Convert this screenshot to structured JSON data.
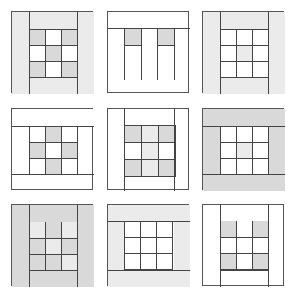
{
  "colors": {
    "gray": "#d9d9d9",
    "light": "#ebebeb",
    "white": "#ffffff",
    "line": "#444444"
  },
  "panels": [
    {
      "x": 11,
      "y": 11,
      "w": 82,
      "h": 82,
      "bands": [
        {
          "x": 0,
          "y": 0,
          "w": 17,
          "h": 82,
          "c": "light"
        },
        {
          "x": 65,
          "y": 0,
          "w": 17,
          "h": 82,
          "c": "light"
        },
        {
          "x": 17,
          "y": 0,
          "w": 48,
          "h": 17,
          "c": "light"
        },
        {
          "x": 17,
          "y": 65,
          "w": 48,
          "h": 17,
          "c": "light"
        }
      ],
      "vlines": [
        {
          "x": 17,
          "y": 0,
          "h": 82
        },
        {
          "x": 65,
          "y": 0,
          "h": 82
        }
      ],
      "hlines": [
        {
          "x": 17,
          "y": 17,
          "w": 48
        }
      ],
      "grid": {
        "x": 17,
        "y": 17,
        "size": 16,
        "cells": [
          "gray",
          "white",
          "gray",
          "white",
          "gray",
          "white",
          "gray",
          "white",
          "gray"
        ],
        "rows": 3
      }
    },
    {
      "x": 107,
      "y": 11,
      "w": 82,
      "h": 82,
      "bands": [],
      "vlines": [
        {
          "x": 16,
          "y": 16,
          "h": 52
        },
        {
          "x": 33,
          "y": 16,
          "h": 52
        },
        {
          "x": 49,
          "y": 16,
          "h": 52
        },
        {
          "x": 66,
          "y": 16,
          "h": 52
        }
      ],
      "hlines": [
        {
          "x": 0,
          "y": 16,
          "w": 82
        },
        {
          "x": 16,
          "y": 33,
          "w": 17
        },
        {
          "x": 49,
          "y": 33,
          "w": 17
        }
      ],
      "grid": {
        "x": 16,
        "y": 16,
        "size": 17,
        "cells": [
          "gray",
          "white",
          "gray"
        ],
        "rows": 1,
        "skipBorders": true
      }
    },
    {
      "x": 202,
      "y": 11,
      "w": 82,
      "h": 82,
      "bands": [
        {
          "x": 0,
          "y": 0,
          "w": 17,
          "h": 82,
          "c": "light"
        },
        {
          "x": 65,
          "y": 0,
          "w": 17,
          "h": 82,
          "c": "light"
        },
        {
          "x": 17,
          "y": 0,
          "w": 48,
          "h": 17,
          "c": "light"
        },
        {
          "x": 17,
          "y": 65,
          "w": 48,
          "h": 17,
          "c": "light"
        }
      ],
      "vlines": [
        {
          "x": 17,
          "y": 0,
          "h": 82
        },
        {
          "x": 65,
          "y": 0,
          "h": 82
        }
      ],
      "hlines": [
        {
          "x": 17,
          "y": 17,
          "w": 48
        },
        {
          "x": 17,
          "y": 65,
          "w": 48
        }
      ],
      "grid": {
        "x": 17,
        "y": 17,
        "size": 16,
        "cells": [
          "white",
          "white",
          "white",
          "white",
          "light",
          "white",
          "white",
          "white",
          "white"
        ],
        "rows": 3
      }
    },
    {
      "x": 11,
      "y": 108,
      "w": 82,
      "h": 82,
      "bands": [
        {
          "x": 0,
          "y": 0,
          "w": 82,
          "h": 17,
          "c": "white"
        }
      ],
      "vlines": [
        {
          "x": 17,
          "y": 17,
          "h": 48
        },
        {
          "x": 65,
          "y": 17,
          "h": 48
        }
      ],
      "hlines": [
        {
          "x": 0,
          "y": 17,
          "w": 82
        },
        {
          "x": 0,
          "y": 65,
          "w": 82
        }
      ],
      "grid": {
        "x": 17,
        "y": 17,
        "size": 16,
        "cells": [
          "white",
          "gray",
          "white",
          "gray",
          "white",
          "gray",
          "white",
          "gray",
          "white"
        ],
        "rows": 3
      }
    },
    {
      "x": 107,
      "y": 108,
      "w": 82,
      "h": 82,
      "bands": [],
      "vlines": [
        {
          "x": 16,
          "y": 0,
          "h": 82
        },
        {
          "x": 66,
          "y": 0,
          "h": 82
        }
      ],
      "hlines": [],
      "grid": {
        "x": 16,
        "y": 16,
        "size": 17,
        "cells": [
          "gray",
          "light",
          "gray",
          "white",
          "light",
          "white",
          "gray",
          "light",
          "gray"
        ],
        "rows": 3
      }
    },
    {
      "x": 202,
      "y": 108,
      "w": 82,
      "h": 82,
      "bands": [
        {
          "x": 0,
          "y": 0,
          "w": 82,
          "h": 17,
          "c": "gray"
        },
        {
          "x": 0,
          "y": 65,
          "w": 82,
          "h": 17,
          "c": "gray"
        },
        {
          "x": 0,
          "y": 17,
          "w": 17,
          "h": 48,
          "c": "gray"
        },
        {
          "x": 65,
          "y": 17,
          "w": 17,
          "h": 48,
          "c": "gray"
        }
      ],
      "vlines": [],
      "hlines": [
        {
          "x": 0,
          "y": 17,
          "w": 82
        },
        {
          "x": 0,
          "y": 65,
          "w": 82
        }
      ],
      "grid": {
        "x": 17,
        "y": 17,
        "size": 16,
        "cells": [
          "white",
          "white",
          "white",
          "white",
          "light",
          "white",
          "white",
          "white",
          "white"
        ],
        "rows": 3
      }
    },
    {
      "x": 11,
      "y": 204,
      "w": 82,
      "h": 82,
      "bands": [
        {
          "x": 0,
          "y": 0,
          "w": 82,
          "h": 82,
          "c": "gray"
        }
      ],
      "vlines": [
        {
          "x": 17,
          "y": 0,
          "h": 82
        },
        {
          "x": 65,
          "y": 0,
          "h": 82
        },
        {
          "x": 33,
          "y": 17,
          "h": 16
        },
        {
          "x": 49,
          "y": 17,
          "h": 16
        }
      ],
      "hlines": [
        {
          "x": 17,
          "y": 65,
          "w": 48
        }
      ],
      "grid": {
        "x": 17,
        "y": 33,
        "size": 16,
        "cells": [
          "gray",
          "light",
          "gray",
          "gray",
          "gray",
          "light"
        ],
        "rows": 2,
        "topCells": [
          "light",
          "gray",
          "light"
        ]
      }
    },
    {
      "x": 107,
      "y": 204,
      "w": 82,
      "h": 82,
      "bands": [
        {
          "x": 0,
          "y": 0,
          "w": 82,
          "h": 16,
          "c": "light"
        },
        {
          "x": 0,
          "y": 65,
          "w": 82,
          "h": 17,
          "c": "light"
        },
        {
          "x": 0,
          "y": 16,
          "w": 16,
          "h": 49,
          "c": "light"
        },
        {
          "x": 66,
          "y": 16,
          "w": 16,
          "h": 49,
          "c": "light"
        }
      ],
      "vlines": [],
      "hlines": [
        {
          "x": 0,
          "y": 16,
          "w": 82
        },
        {
          "x": 0,
          "y": 65,
          "w": 82
        }
      ],
      "grid": {
        "x": 16,
        "y": 16,
        "size": 16,
        "cells": [
          "white",
          "white",
          "white",
          "white",
          "white",
          "white",
          "white",
          "white",
          "white"
        ],
        "rows": 3
      }
    },
    {
      "x": 202,
      "y": 204,
      "w": 82,
      "h": 82,
      "bands": [],
      "vlines": [
        {
          "x": 17,
          "y": 0,
          "h": 82
        },
        {
          "x": 65,
          "y": 0,
          "h": 82
        }
      ],
      "hlines": [
        {
          "x": 17,
          "y": 65,
          "w": 48
        }
      ],
      "grid": {
        "x": 17,
        "y": 16,
        "size": 16,
        "cells": [
          "gray",
          "white",
          "gray",
          "white",
          "white",
          "white",
          "gray",
          "white",
          "gray"
        ],
        "rows": 3,
        "openTop": true
      }
    }
  ]
}
